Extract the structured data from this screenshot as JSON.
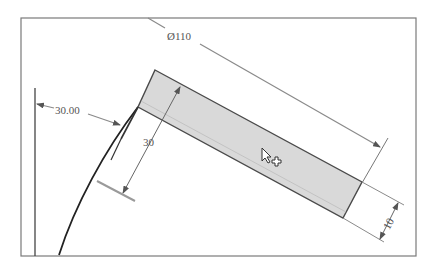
{
  "viewport": {
    "background": "#ffffff",
    "frame_color": "#6e6e6e"
  },
  "sketch": {
    "part_fill": "#d9d9d9",
    "part_edge": "#4a4a4a",
    "arc_color": "#222222",
    "dimension_color": "#7a7a7a"
  },
  "dimensions": {
    "diameter": {
      "label": "Ø110"
    },
    "offset": {
      "label": "30.00"
    },
    "width": {
      "label": "30"
    },
    "thickness": {
      "label": "10"
    }
  },
  "cursor": {
    "type": "arrow-with-plus",
    "description": "select/add cursor"
  }
}
